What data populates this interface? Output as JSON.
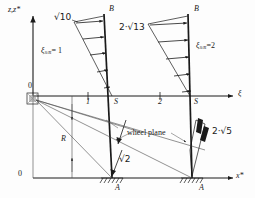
{
  "figure": {
    "kind": "technical-diagram"
  },
  "axes": {
    "vertical_label": "z,z*",
    "horizontal_upper_label": "ξ",
    "horizontal_lower_label": "x*",
    "origin_upper_label": "0",
    "origin_lower_label": "0"
  },
  "ticks": {
    "upper": [
      "1",
      "S",
      "2",
      "S"
    ],
    "upper_positions": [
      88,
      112,
      160,
      190
    ]
  },
  "nodes": {
    "top_left": "B",
    "top_right": "B",
    "bottom_left": "A",
    "bottom_right": "A"
  },
  "labels": {
    "sqrt10": "√10",
    "two_sqrt13": "2·√13",
    "xi_left": "ξ",
    "xi_left_sub": "S/R",
    "xi_left_val": "= 1",
    "xi_right": "ξ",
    "xi_right_sub": "S/R",
    "xi_right_val": "=2",
    "wheel_plane": "wheel plane",
    "sqrt2": "√2",
    "two_sqrt5": "2·√5",
    "radius": "R"
  },
  "colors": {
    "stroke": "#1a1a1a",
    "thin": "#4a4a4a",
    "background": "#fdfdfd"
  }
}
